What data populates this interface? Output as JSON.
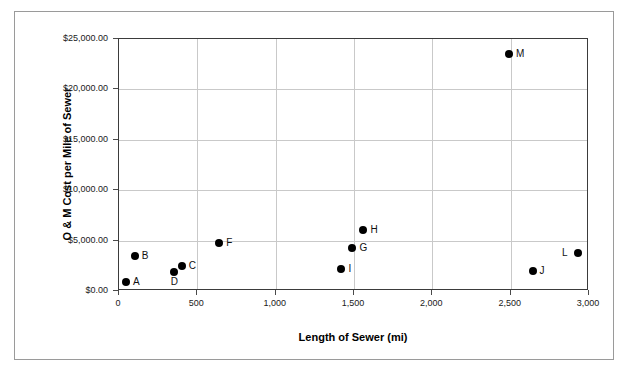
{
  "chart_data": {
    "type": "scatter",
    "title": "",
    "xlabel": "Length of Sewer (mi)",
    "ylabel": "O & M Cost per Mile of Sewer",
    "xlim": [
      0,
      3000
    ],
    "ylim": [
      0,
      25000
    ],
    "xticks": [
      0,
      500,
      1000,
      1500,
      2000,
      2500,
      3000
    ],
    "xtick_labels": [
      "0",
      "500",
      "1,000",
      "1,500",
      "2,000",
      "2,500",
      "3,000"
    ],
    "yticks": [
      0,
      5000,
      10000,
      15000,
      20000,
      25000
    ],
    "ytick_labels": [
      "$0.00",
      "$5,000.00",
      "$10,000.00",
      "$15,000.00",
      "$20,000.00",
      "$25,000.00"
    ],
    "grid": "both",
    "legend": "none",
    "marker_color": "#000000",
    "points": [
      {
        "label": "A",
        "x": 45,
        "y": 890,
        "label_pos": "right"
      },
      {
        "label": "B",
        "x": 100,
        "y": 3470,
        "label_pos": "right"
      },
      {
        "label": "C",
        "x": 400,
        "y": 2480,
        "label_pos": "right"
      },
      {
        "label": "D",
        "x": 350,
        "y": 1890,
        "label_pos": "below"
      },
      {
        "label": "F",
        "x": 640,
        "y": 4760,
        "label_pos": "right"
      },
      {
        "label": "G",
        "x": 1490,
        "y": 4270,
        "label_pos": "right"
      },
      {
        "label": "H",
        "x": 1560,
        "y": 6050,
        "label_pos": "right"
      },
      {
        "label": "I",
        "x": 1420,
        "y": 2180,
        "label_pos": "right"
      },
      {
        "label": "J",
        "x": 2640,
        "y": 1980,
        "label_pos": "right"
      },
      {
        "label": "L",
        "x": 2930,
        "y": 3770,
        "label_pos": "left"
      },
      {
        "label": "M",
        "x": 2490,
        "y": 23500,
        "label_pos": "right"
      }
    ]
  }
}
